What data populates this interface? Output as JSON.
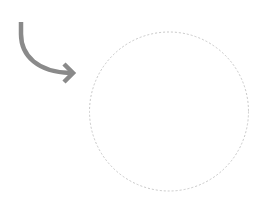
{
  "diagram": {
    "arrow": {
      "icon": "curved-arrow-icon",
      "color": "#8a8a8a",
      "stroke_width": 4.5
    },
    "target_circle": {
      "shape": "dashed-circle",
      "stroke_color": "#c8c8c8",
      "fill_color": "#ffffff",
      "stroke_width": 1,
      "dash": "2 2"
    }
  }
}
